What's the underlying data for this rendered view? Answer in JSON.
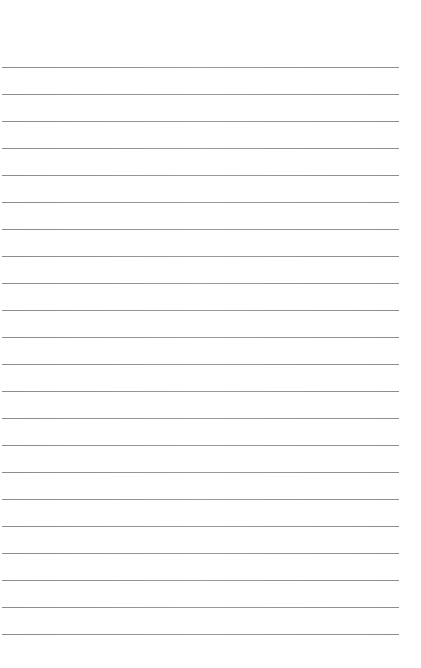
{
  "page": {
    "type": "lined-paper",
    "background_color": "#ffffff",
    "line_color": "#8c8c8c",
    "line_count": 22,
    "first_line_y": 67,
    "line_spacing": 27,
    "line_left": 2,
    "line_right": 399
  }
}
